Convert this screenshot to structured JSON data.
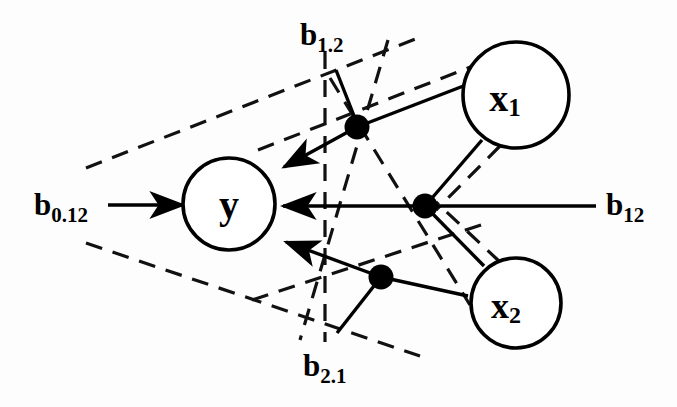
{
  "figure": {
    "type": "path-diagram",
    "background_color": "#fdfdfd",
    "stroke_color": "#000000"
  },
  "nodes": [
    {
      "id": "y",
      "label": "y",
      "cx": 229,
      "cy": 204,
      "r": 46
    },
    {
      "id": "x1",
      "label": "x",
      "sub": "1",
      "cx": 516,
      "cy": 95,
      "r": 53
    },
    {
      "id": "x2",
      "label": "x",
      "sub": "2",
      "cx": 516,
      "cy": 303,
      "r": 45
    }
  ],
  "coefficients": [
    {
      "id": "b1_2",
      "base": "b",
      "sub": "1.2",
      "x": 300,
      "y": 45,
      "anchor": "start",
      "meaning": "partial regression coefficient of x1 controlling for x2"
    },
    {
      "id": "b0_12",
      "base": "b",
      "sub": "0.12",
      "x": 34,
      "y": 215,
      "anchor": "start",
      "meaning": "intercept given x1 and x2"
    },
    {
      "id": "b12",
      "base": "b",
      "sub": "12",
      "x": 606,
      "y": 215,
      "anchor": "start",
      "meaning": "joint coefficient of x1 and x2"
    },
    {
      "id": "b2_1",
      "base": "b",
      "sub": "2.1",
      "x": 303,
      "y": 376,
      "anchor": "start",
      "meaning": "partial regression coefficient of x2 controlling for x1"
    }
  ],
  "junction_dots": [
    {
      "id": "dot-upper",
      "cx": 357,
      "cy": 127,
      "r": 12
    },
    {
      "id": "dot-middle",
      "cx": 425,
      "cy": 206,
      "r": 12
    },
    {
      "id": "dot-lower",
      "cx": 381,
      "cy": 277,
      "r": 12
    }
  ],
  "solid_paths": [
    {
      "id": "x1-to-upper-dot",
      "d": "M 466,85 L 357,127",
      "arrow": false
    },
    {
      "id": "upper-dot-to-y",
      "d": "M 357,127 L 279,170",
      "arrow": true
    },
    {
      "id": "b0-12-to-y",
      "d": "M 108,205 L 180,205",
      "arrow": true
    },
    {
      "id": "b12-to-y",
      "d": "M 596,206 L 279,206",
      "arrow": true
    },
    {
      "id": "x2-to-lower-dot",
      "d": "M 468,296 L 381,277",
      "arrow": false
    },
    {
      "id": "lower-dot-to-y",
      "d": "M 381,277 L 281,240",
      "arrow": true
    },
    {
      "id": "b1-2-stem",
      "d": "M 336,70 L 358,126",
      "arrow": false
    },
    {
      "id": "b2-1-stem",
      "d": "M 381,277 L 337,333",
      "arrow": false
    }
  ],
  "dashed_paths": [
    {
      "id": "vertical-divider",
      "d": "M 325,52 L 325,342"
    },
    {
      "id": "upper-envelope-left",
      "d": "M 86,168 L 418,38"
    },
    {
      "id": "lower-envelope-left",
      "d": "M 86,243 L 420,356"
    },
    {
      "id": "upper-envelope-right",
      "d": "M 330,78 L 470,305"
    },
    {
      "id": "lower-envelope-right",
      "d": "M 388,40 L 300,340"
    },
    {
      "id": "x1-upper-chord",
      "d": "M 258,150 L 478,64"
    },
    {
      "id": "x2-lower-chord",
      "d": "M 252,300 L 490,222"
    },
    {
      "id": "x1-down-to-center",
      "d": "M 500,146 L 436,210"
    },
    {
      "id": "x2-up-to-center",
      "d": "M 500,262 L 436,202"
    }
  ],
  "arrowhead": {
    "width": 22,
    "height": 15
  }
}
